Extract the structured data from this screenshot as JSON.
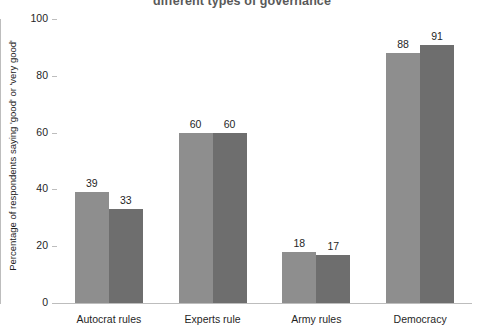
{
  "chart_data": {
    "type": "bar",
    "title": "different types of governance",
    "subtitle": "",
    "xlabel": "",
    "ylabel": "Percentage of respondents saying 'good' or 'very good'",
    "categories": [
      "Autocrat rules",
      "Experts rule",
      "Army rules",
      "Democracy"
    ],
    "series": [
      {
        "name": "series-1",
        "color": "#8e8e8e",
        "values": [
          39,
          60,
          18,
          88
        ]
      },
      {
        "name": "series-2",
        "color": "#6e6e6e",
        "values": [
          33,
          60,
          17,
          91
        ]
      }
    ],
    "ylim": [
      0,
      100
    ],
    "yticks": [
      0,
      20,
      40,
      60,
      80,
      100
    ],
    "ytick_labels": [
      "0",
      "20",
      "40",
      "60",
      "80",
      "100"
    ],
    "grid": false,
    "legend": "none",
    "data_labels": true,
    "axis_color": "#bdbdbd"
  }
}
